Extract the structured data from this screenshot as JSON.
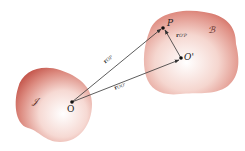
{
  "diagram": {
    "bodies": [
      {
        "id": "left-body",
        "label": "𝒥",
        "color": "#c9544a"
      },
      {
        "id": "right-body",
        "label": "ℬ",
        "color": "#c9544a"
      }
    ],
    "points": {
      "O": "O",
      "P": "P",
      "O_prime": "O'"
    },
    "vectors": [
      {
        "id": "r_OP",
        "symbol": "r",
        "subscript": "OP",
        "from": "O",
        "to": "P"
      },
      {
        "id": "r_OO'",
        "symbol": "r",
        "subscript": "OO'",
        "from": "O",
        "to": "O'"
      },
      {
        "id": "r_O'P",
        "symbol": "r",
        "subscript": "O'P",
        "from": "O'",
        "to": "P"
      }
    ],
    "colors": {
      "body_edge": "#c65a50",
      "body_center": "#ffffff",
      "arrow": "#333333"
    }
  }
}
